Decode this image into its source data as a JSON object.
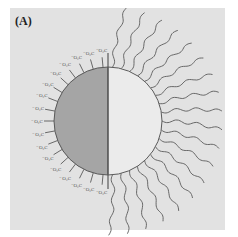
{
  "figure": {
    "panel_label": "(A)",
    "headgroup_label": "⁻O₂C",
    "colors": {
      "background": "#e2e2e2",
      "polar_half": "#a5a5a5",
      "nonpolar_half": "#ebebeb",
      "outline": "#5a5a5a"
    },
    "particle": {
      "cx": 108,
      "cy": 121,
      "r": 54
    },
    "left_headgroups_count": 17,
    "right_tails_count": 19
  }
}
